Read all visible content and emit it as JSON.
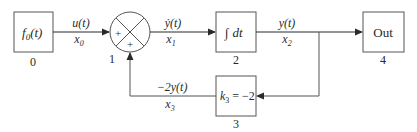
{
  "diagram": {
    "type": "block-diagram",
    "blocks": [
      {
        "id": "0",
        "label": "f0(t)",
        "label_main": "f",
        "label_sub": "0",
        "label_rest": "(t)",
        "number": "0"
      },
      {
        "id": "1",
        "type": "summing-junction",
        "signs": [
          "+",
          "+"
        ],
        "number": "1"
      },
      {
        "id": "2",
        "label": "∫ dt",
        "label_integral": "∫",
        "label_rest": "dt",
        "number": "2"
      },
      {
        "id": "3",
        "label": "k3 = −2",
        "label_main": "k",
        "label_sub": "3",
        "label_rest": " = −2",
        "number": "3"
      },
      {
        "id": "4",
        "label": "Out",
        "number": "4"
      }
    ],
    "signals": [
      {
        "from": "0",
        "to": "1",
        "top": "u(t)",
        "bottom_main": "x",
        "bottom_sub": "0"
      },
      {
        "from": "1",
        "to": "2",
        "top": "ẏ(t)",
        "bottom_main": "x",
        "bottom_sub": "1"
      },
      {
        "from": "2",
        "to": "4",
        "top": "y(t)",
        "bottom_main": "x",
        "bottom_sub": "2"
      },
      {
        "from": "3",
        "to": "1",
        "top": "−2y(t)",
        "bottom_main": "x",
        "bottom_sub": "3"
      }
    ],
    "colors": {
      "line": "#2a2a2a",
      "box": "#555555"
    }
  }
}
